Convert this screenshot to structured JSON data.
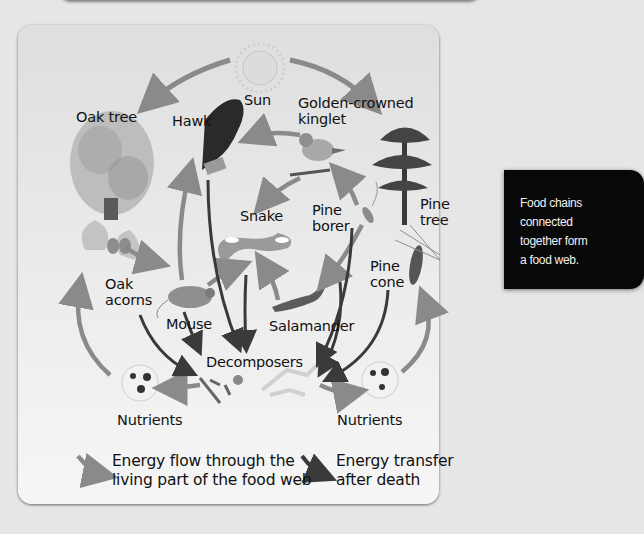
{
  "figure": {
    "title": "Food web",
    "organisms": {
      "sun": "Sun",
      "oak_tree": "Oak tree",
      "hawk": "Hawk",
      "kinglet": "Golden-crowned\nkinglet",
      "pine_tree": "Pine\ntree",
      "snake": "Snake",
      "pine_borer": "Pine\nborer",
      "pine_cone": "Pine\ncone",
      "oak_acorns": "Oak\nacorns",
      "mouse": "Mouse",
      "salamander": "Salamander",
      "decomposers": "Decomposers",
      "nutrients_left": "Nutrients",
      "nutrients_right": "Nutrients"
    },
    "legend": {
      "living_flow": "Energy flow through the\nliving part of the food web",
      "after_death": "Energy transfer\nafter death"
    },
    "colors": {
      "living_arrow": "#8a8a8a",
      "death_arrow": "#3a3a3a",
      "panel_bg": "#ececec",
      "page_bg": "#e6e6e6",
      "callout_bg": "#080808"
    }
  },
  "callout": {
    "text": "Food chains\nconnected\ntogether form\na food web."
  }
}
